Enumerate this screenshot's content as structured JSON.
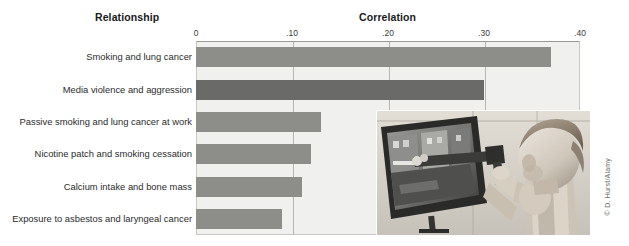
{
  "headings": {
    "relationship": "Relationship",
    "correlation": "Correlation"
  },
  "photo": {
    "alt": "Toddler aiming a toy gun at a television screen showing a video game",
    "credit": "© D. Hurst/Alamy"
  },
  "chart_data": {
    "type": "bar",
    "orientation": "horizontal",
    "title": "Correlation",
    "xlabel": "Correlation",
    "ylabel": "Relationship",
    "xlim": [
      0,
      0.42
    ],
    "grid": true,
    "legend": false,
    "tick_labels": [
      "0",
      ".10",
      ".20",
      ".30",
      ".40"
    ],
    "tick_values": [
      0,
      0.1,
      0.2,
      0.3,
      0.4
    ],
    "categories": [
      "Smoking and lung cancer",
      "Media violence and aggression",
      "Passive smoking and lung cancer at work",
      "Nicotine patch and smoking cessation",
      "Calcium intake and bone mass",
      "Exposure to asbestos and laryngeal cancer"
    ],
    "values": [
      0.37,
      0.3,
      0.13,
      0.12,
      0.11,
      0.09
    ],
    "bar_colors": [
      "#8d8d8a",
      "#6a6a68",
      "#8d8d8a",
      "#8d8d8a",
      "#8d8d8a",
      "#8d8d8a"
    ],
    "highlight_index": 1,
    "plot_background": "#f0f0ee",
    "gridline_color": "#b6b6b0"
  }
}
